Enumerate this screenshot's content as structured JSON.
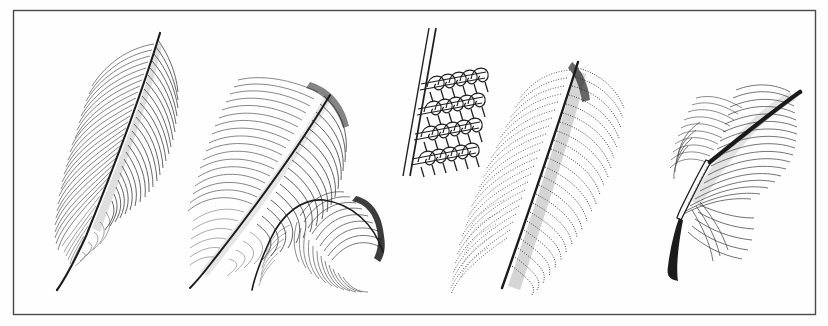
{
  "plate": {
    "title": "Feathers",
    "medium": "engraving",
    "background_color": "#fefefe",
    "ink_color": "#1a1a1a",
    "border": {
      "name": "plate-border",
      "x": 13,
      "y": 10,
      "width": 802,
      "height": 304,
      "stroke_color": "#4a4a4a",
      "stroke_width": 1.4
    },
    "width": 828,
    "height": 326
  },
  "figures": [
    {
      "id": "fig-1",
      "name": "contour-feather-left",
      "label": "Contour feather",
      "description": "Large pennaceous contour feather, tip up-right, fine parallel barb hatching, downy barbs at base, slender tapering calamus",
      "ink_color": "#2a2a2a",
      "tip": {
        "x": 160,
        "y": 33
      },
      "base": {
        "x": 57,
        "y": 290
      },
      "rachis_width": 2.2,
      "vane_style": "line-hatched",
      "barb_count": 64
    },
    {
      "id": "fig-2",
      "name": "contour-feather-second",
      "label": "Broad contour feather",
      "description": "Broad curved contour feather with dense hatched vane arching right, soft downy base and thin quill",
      "ink_color": "#2a2a2a",
      "tip": {
        "x": 330,
        "y": 95
      },
      "base": {
        "x": 190,
        "y": 288
      },
      "rachis_width": 2.0,
      "vane_style": "line-hatched",
      "barb_count": 58
    },
    {
      "id": "fig-3",
      "name": "curved-semiplume-feather",
      "label": "Curved semiplume",
      "description": "Small hook-shaped semiplume feather curving up and right, loose barbs, sharp dark tip",
      "ink_color": "#2a2a2a",
      "tip": {
        "x": 383,
        "y": 252
      },
      "base": {
        "x": 252,
        "y": 290
      },
      "rachis_width": 1.6,
      "vane_style": "loose-barbs",
      "barb_count": 40
    },
    {
      "id": "fig-4",
      "name": "downy-plumulaceous-feather",
      "label": "Downy plumulaceous feather",
      "description": "Large soft down feather rendered in stipple dots, barbs splaying left and right from a dark central rachis",
      "ink_color": "#333333",
      "tip": {
        "x": 578,
        "y": 62
      },
      "base": {
        "x": 502,
        "y": 288
      },
      "rachis_width": 2.4,
      "vane_style": "stippled",
      "barb_count": 52
    },
    {
      "id": "fig-5",
      "name": "quilled-feather-right",
      "label": "Feather with calamus",
      "description": "Feather with a thick hollow quill shaft running lower-left to upper-right, hatched vane sweeping right, loose barbs below",
      "ink_color": "#2a2a2a",
      "tip": {
        "x": 800,
        "y": 92
      },
      "base": {
        "x": 678,
        "y": 281
      },
      "rachis_width": 4.5,
      "vane_style": "line-hatched",
      "barb_count": 46
    },
    {
      "id": "fig-6",
      "name": "barbule-hooklet-diagram",
      "label": "Barbule and hooklet detail",
      "description": "Magnified diagram of interlocking barbules: a diagonal barb shaft with four rows of curled hooklets (hamuli) gripping cross barbules",
      "ink_color": "#1a1a1a",
      "rows": 4,
      "hooks_per_row": 9,
      "shaft_start": {
        "x": 432,
        "y": 30
      },
      "shaft_end": {
        "x": 408,
        "y": 175
      }
    }
  ]
}
